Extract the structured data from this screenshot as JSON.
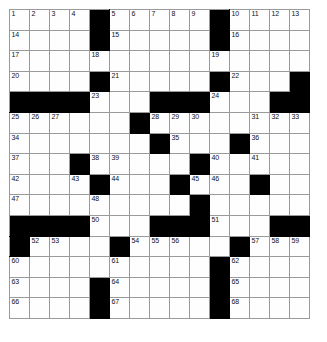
{
  "puzzle": {
    "type": "crossword-grid",
    "rows": 15,
    "cols": 15,
    "cell_size_px": 21,
    "colors": {
      "block": "#000000",
      "open": "#fefefe",
      "gridline": "#9a9a9a",
      "number": "#111111",
      "background": "#ffffff"
    },
    "grid": [
      [
        "o",
        "o",
        "o",
        "o",
        "b",
        "o",
        "o",
        "o",
        "o",
        "o",
        "b",
        "o",
        "o",
        "o",
        "o"
      ],
      [
        "o",
        "o",
        "o",
        "o",
        "b",
        "o",
        "o",
        "o",
        "o",
        "o",
        "b",
        "o",
        "o",
        "o",
        "o"
      ],
      [
        "o",
        "o",
        "o",
        "o",
        "o",
        "o",
        "o",
        "o",
        "o",
        "o",
        "o",
        "o",
        "o",
        "o",
        "o"
      ],
      [
        "o",
        "o",
        "o",
        "o",
        "b",
        "o",
        "o",
        "o",
        "o",
        "o",
        "b",
        "o",
        "o",
        "o",
        "b"
      ],
      [
        "b",
        "b",
        "b",
        "b",
        "o",
        "o",
        "o",
        "b",
        "b",
        "b",
        "o",
        "o",
        "o",
        "b",
        "b"
      ],
      [
        "o",
        "o",
        "o",
        "o",
        "o",
        "o",
        "b",
        "o",
        "o",
        "o",
        "o",
        "o",
        "o",
        "o",
        "o"
      ],
      [
        "o",
        "o",
        "o",
        "o",
        "o",
        "o",
        "o",
        "b",
        "o",
        "o",
        "o",
        "b",
        "o",
        "o",
        "o"
      ],
      [
        "o",
        "o",
        "o",
        "b",
        "o",
        "o",
        "o",
        "o",
        "o",
        "b",
        "o",
        "o",
        "o",
        "o",
        "o"
      ],
      [
        "o",
        "o",
        "o",
        "o",
        "b",
        "o",
        "o",
        "o",
        "b",
        "o",
        "o",
        "o",
        "b",
        "o",
        "o"
      ],
      [
        "o",
        "o",
        "o",
        "o",
        "o",
        "o",
        "o",
        "o",
        "o",
        "b",
        "o",
        "o",
        "o",
        "o",
        "o"
      ],
      [
        "b",
        "b",
        "b",
        "b",
        "o",
        "o",
        "o",
        "b",
        "b",
        "b",
        "o",
        "o",
        "o",
        "b",
        "b"
      ],
      [
        "b",
        "o",
        "o",
        "o",
        "o",
        "b",
        "o",
        "o",
        "o",
        "o",
        "o",
        "b",
        "o",
        "o",
        "o"
      ],
      [
        "o",
        "o",
        "o",
        "o",
        "o",
        "o",
        "o",
        "o",
        "o",
        "o",
        "b",
        "o",
        "o",
        "o",
        "o"
      ],
      [
        "o",
        "o",
        "o",
        "o",
        "b",
        "o",
        "o",
        "o",
        "o",
        "o",
        "b",
        "o",
        "o",
        "o",
        "o"
      ],
      [
        "o",
        "o",
        "o",
        "o",
        "b",
        "o",
        "o",
        "o",
        "o",
        "o",
        "b",
        "o",
        "o",
        "o",
        "o"
      ]
    ],
    "numbers": [
      {
        "row": 0,
        "col": 0,
        "n": "1"
      },
      {
        "row": 0,
        "col": 1,
        "n": "2"
      },
      {
        "row": 0,
        "col": 2,
        "n": "3"
      },
      {
        "row": 0,
        "col": 3,
        "n": "4"
      },
      {
        "row": 0,
        "col": 5,
        "n": "5"
      },
      {
        "row": 0,
        "col": 6,
        "n": "6"
      },
      {
        "row": 0,
        "col": 7,
        "n": "7"
      },
      {
        "row": 0,
        "col": 8,
        "n": "8"
      },
      {
        "row": 0,
        "col": 9,
        "n": "9"
      },
      {
        "row": 0,
        "col": 11,
        "n": "10"
      },
      {
        "row": 0,
        "col": 12,
        "n": "11"
      },
      {
        "row": 0,
        "col": 13,
        "n": "12"
      },
      {
        "row": 0,
        "col": 14,
        "n": "13"
      },
      {
        "row": 1,
        "col": 0,
        "n": "14"
      },
      {
        "row": 1,
        "col": 5,
        "n": "15"
      },
      {
        "row": 1,
        "col": 11,
        "n": "16"
      },
      {
        "row": 2,
        "col": 0,
        "n": "17"
      },
      {
        "row": 2,
        "col": 4,
        "n": "18"
      },
      {
        "row": 2,
        "col": 10,
        "n": "19"
      },
      {
        "row": 3,
        "col": 0,
        "n": "20"
      },
      {
        "row": 3,
        "col": 5,
        "n": "21"
      },
      {
        "row": 3,
        "col": 11,
        "n": "22"
      },
      {
        "row": 4,
        "col": 4,
        "n": "23"
      },
      {
        "row": 4,
        "col": 10,
        "n": "24"
      },
      {
        "row": 5,
        "col": 0,
        "n": "25"
      },
      {
        "row": 5,
        "col": 1,
        "n": "26"
      },
      {
        "row": 5,
        "col": 2,
        "n": "27"
      },
      {
        "row": 5,
        "col": 7,
        "n": "28"
      },
      {
        "row": 5,
        "col": 8,
        "n": "29"
      },
      {
        "row": 5,
        "col": 9,
        "n": "30"
      },
      {
        "row": 5,
        "col": 12,
        "n": "31"
      },
      {
        "row": 5,
        "col": 13,
        "n": "32"
      },
      {
        "row": 5,
        "col": 14,
        "n": "33"
      },
      {
        "row": 6,
        "col": 0,
        "n": "34"
      },
      {
        "row": 6,
        "col": 8,
        "n": "35"
      },
      {
        "row": 6,
        "col": 12,
        "n": "36"
      },
      {
        "row": 7,
        "col": 0,
        "n": "37"
      },
      {
        "row": 7,
        "col": 4,
        "n": "38"
      },
      {
        "row": 7,
        "col": 5,
        "n": "39"
      },
      {
        "row": 7,
        "col": 10,
        "n": "40"
      },
      {
        "row": 7,
        "col": 12,
        "n": "41"
      },
      {
        "row": 8,
        "col": 0,
        "n": "42"
      },
      {
        "row": 8,
        "col": 3,
        "n": "43"
      },
      {
        "row": 8,
        "col": 5,
        "n": "44"
      },
      {
        "row": 8,
        "col": 9,
        "n": "45"
      },
      {
        "row": 8,
        "col": 10,
        "n": "46"
      },
      {
        "row": 9,
        "col": 0,
        "n": "47"
      },
      {
        "row": 9,
        "col": 4,
        "n": "48"
      },
      {
        "row": 9,
        "col": 9,
        "n": "49"
      },
      {
        "row": 10,
        "col": 4,
        "n": "50"
      },
      {
        "row": 10,
        "col": 10,
        "n": "51"
      },
      {
        "row": 11,
        "col": 1,
        "n": "52"
      },
      {
        "row": 11,
        "col": 2,
        "n": "53"
      },
      {
        "row": 11,
        "col": 6,
        "n": "54"
      },
      {
        "row": 11,
        "col": 7,
        "n": "55"
      },
      {
        "row": 11,
        "col": 8,
        "n": "56"
      },
      {
        "row": 11,
        "col": 12,
        "n": "57"
      },
      {
        "row": 11,
        "col": 13,
        "n": "58"
      },
      {
        "row": 11,
        "col": 14,
        "n": "59"
      },
      {
        "row": 12,
        "col": 0,
        "n": "60"
      },
      {
        "row": 12,
        "col": 5,
        "n": "61"
      },
      {
        "row": 12,
        "col": 11,
        "n": "62"
      },
      {
        "row": 13,
        "col": 0,
        "n": "63"
      },
      {
        "row": 13,
        "col": 5,
        "n": "64"
      },
      {
        "row": 13,
        "col": 11,
        "n": "65"
      },
      {
        "row": 14,
        "col": 0,
        "n": "66"
      },
      {
        "row": 14,
        "col": 5,
        "n": "67"
      },
      {
        "row": 14,
        "col": 11,
        "n": "68"
      }
    ],
    "letters": []
  }
}
